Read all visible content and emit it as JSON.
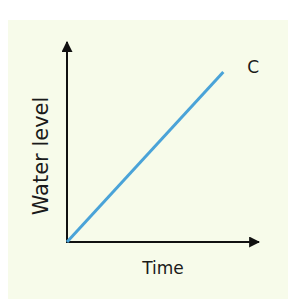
{
  "chart_data": {
    "type": "line",
    "title": "",
    "xlabel": "Time",
    "ylabel": "Water level",
    "xlim": [
      0,
      1
    ],
    "ylim": [
      0,
      1
    ],
    "grid": false,
    "series": [
      {
        "name": "C",
        "color": "#4aa3d8",
        "x": [
          0,
          0.81
        ],
        "y": [
          0,
          0.85
        ]
      }
    ],
    "annotations": [
      {
        "text": "C",
        "series": "C",
        "position": "end-of-line"
      }
    ]
  },
  "colors": {
    "background": "#f7fbea",
    "axis": "#111111"
  }
}
